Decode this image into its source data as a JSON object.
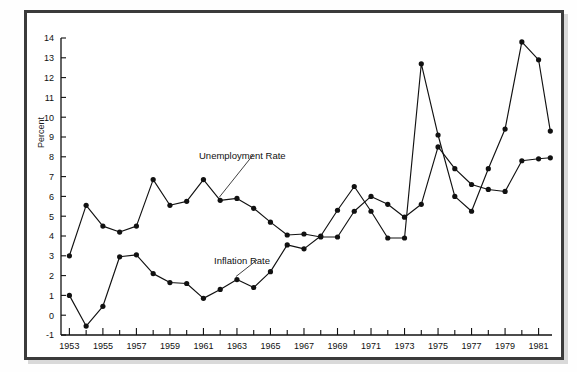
{
  "figure": {
    "caption_clipped": "",
    "ylabel": "Percent",
    "annotations": [
      {
        "name": "unemployment-label",
        "text": "Unemployment Rate"
      },
      {
        "name": "inflation-label",
        "text": "Inflation Rate"
      }
    ],
    "colors": {
      "ink": "#111111",
      "frame": "#3b3b3b",
      "page": "#ffffff"
    }
  },
  "chart_data": {
    "type": "line",
    "title": "",
    "xlabel": "",
    "ylabel": "Percent",
    "xlim": [
      1952.5,
      1981.8
    ],
    "ylim": [
      -1,
      14
    ],
    "ytick_labels": [
      "-1",
      "0",
      "1",
      "2",
      "3",
      "4",
      "5",
      "6",
      "7",
      "8",
      "9",
      "10",
      "11",
      "12",
      "13",
      "14"
    ],
    "yticks": [
      -1,
      0,
      1,
      2,
      3,
      4,
      5,
      6,
      7,
      8,
      9,
      10,
      11,
      12,
      13,
      14
    ],
    "xtick_labels": [
      "1953",
      "1955",
      "1957",
      "1959",
      "1961",
      "1963",
      "1965",
      "1967",
      "1969",
      "1971",
      "1973",
      "1975",
      "1977",
      "1979",
      "1981"
    ],
    "xticks_major": [
      1953,
      1955,
      1957,
      1959,
      1961,
      1963,
      1965,
      1967,
      1969,
      1971,
      1973,
      1975,
      1977,
      1979,
      1981
    ],
    "xticks_minor": [
      1954,
      1956,
      1958,
      1960,
      1962,
      1964,
      1966,
      1968,
      1970,
      1972,
      1974,
      1976,
      1978,
      1980
    ],
    "grid": false,
    "legend_position": "inline-annotation",
    "markers": "filled-circle",
    "x": [
      1953,
      1954,
      1955,
      1956,
      1957,
      1958,
      1959,
      1960,
      1961,
      1962,
      1963,
      1964,
      1965,
      1966,
      1967,
      1968,
      1969,
      1970,
      1971,
      1972,
      1973,
      1974,
      1975,
      1976,
      1977,
      1978,
      1979,
      1980,
      1981
    ],
    "series": [
      {
        "name": "Unemployment Rate",
        "color": "#111111",
        "values": [
          3.0,
          5.55,
          4.5,
          4.2,
          4.5,
          6.85,
          5.55,
          5.75,
          6.85,
          5.8,
          5.9,
          5.4,
          4.7,
          4.05,
          4.1,
          3.95,
          3.95,
          5.25,
          6.0,
          5.6,
          4.95,
          5.6,
          8.5,
          7.4,
          6.6,
          6.35,
          6.25,
          7.8,
          7.9
        ]
      },
      {
        "name": "Inflation Rate",
        "color": "#111111",
        "values": [
          1.0,
          -0.55,
          0.45,
          2.95,
          3.05,
          2.1,
          1.65,
          1.6,
          0.85,
          1.3,
          1.8,
          1.4,
          2.2,
          3.55,
          3.35,
          4.0,
          5.3,
          6.5,
          5.25,
          3.9,
          3.9,
          12.7,
          9.1,
          6.0,
          5.25,
          7.4,
          9.4,
          13.8,
          12.9
        ]
      }
    ],
    "extra_points": [
      {
        "series": "Inflation Rate",
        "x": 1981.7,
        "y": 9.3
      },
      {
        "series": "Unemployment Rate",
        "x": 1981.7,
        "y": 7.95
      }
    ]
  }
}
